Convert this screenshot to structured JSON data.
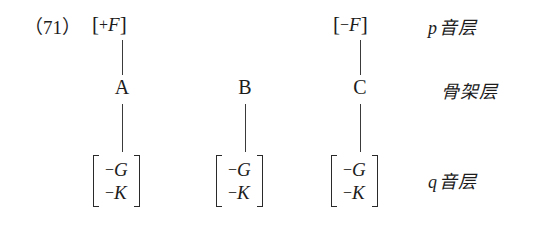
{
  "figure": {
    "example_number": "（71）",
    "columns": [
      {
        "id": "A",
        "top_feature": {
          "open": "[",
          "sign": "+",
          "variable": "F",
          "close": "]"
        },
        "skeleton_node": "A",
        "bottom_matrix": [
          {
            "sign": "−",
            "variable": "G"
          },
          {
            "sign": "−",
            "variable": "K"
          }
        ],
        "has_top_feature": true,
        "has_top_line": true,
        "has_bottom_line": true
      },
      {
        "id": "B",
        "top_feature": null,
        "skeleton_node": "B",
        "bottom_matrix": [
          {
            "sign": "−",
            "variable": "G"
          },
          {
            "sign": "−",
            "variable": "K"
          }
        ],
        "has_top_feature": false,
        "has_top_line": false,
        "has_bottom_line": true
      },
      {
        "id": "C",
        "top_feature": {
          "open": "[",
          "sign": "−",
          "variable": "F",
          "close": "]"
        },
        "skeleton_node": "C",
        "bottom_matrix": [
          {
            "sign": "−",
            "variable": "G"
          },
          {
            "sign": "−",
            "variable": "K"
          }
        ],
        "has_top_feature": true,
        "has_top_line": true,
        "has_bottom_line": true
      }
    ],
    "tiers": [
      {
        "variable": "p",
        "label": "音层"
      },
      {
        "variable": "",
        "label": "骨架层"
      },
      {
        "variable": "q",
        "label": "音层"
      }
    ],
    "colors": {
      "text": "#1c1c1c",
      "line": "#3a3a3a",
      "background": "#ffffff"
    }
  }
}
